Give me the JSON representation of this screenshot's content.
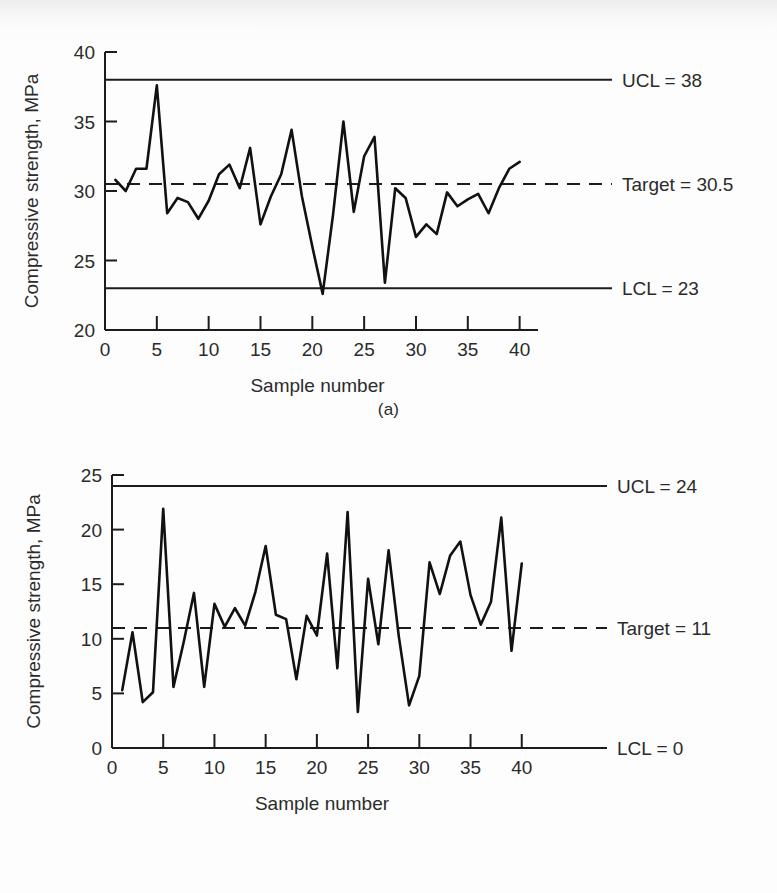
{
  "figures": [
    {
      "id": "a",
      "caption": "(a)",
      "chart_data": {
        "type": "line",
        "title": "",
        "xlabel": "Sample number",
        "ylabel": "Compressive strength, MPa",
        "xlim": [
          0,
          41
        ],
        "ylim": [
          20,
          40
        ],
        "xticks": [
          0,
          5,
          10,
          15,
          20,
          25,
          30,
          35,
          40
        ],
        "yticks": [
          20,
          25,
          30,
          35,
          40
        ],
        "grid": false,
        "legend_position": "right-inline",
        "x": [
          1,
          2,
          3,
          4,
          5,
          6,
          7,
          8,
          9,
          10,
          11,
          12,
          13,
          14,
          15,
          16,
          17,
          18,
          19,
          20,
          21,
          22,
          23,
          24,
          25,
          26,
          27,
          28,
          29,
          30,
          31,
          32,
          33,
          34,
          35,
          36,
          37,
          38,
          39,
          40
        ],
        "values": [
          30.8,
          30.0,
          31.6,
          31.6,
          37.6,
          28.4,
          29.5,
          29.2,
          28.0,
          29.3,
          31.2,
          31.9,
          30.2,
          33.1,
          27.6,
          29.6,
          31.2,
          34.4,
          29.6,
          26.0,
          22.6,
          28.3,
          35.0,
          28.5,
          32.5,
          33.9,
          23.4,
          30.2,
          29.5,
          26.7,
          27.6,
          26.9,
          29.9,
          28.9,
          29.4,
          29.8,
          28.4,
          30.2,
          31.6,
          32.1
        ],
        "reference_lines": [
          {
            "name": "UCL",
            "label": "UCL = 38",
            "value": 38,
            "style": "solid"
          },
          {
            "name": "Target",
            "label": "Target = 30.5",
            "value": 30.5,
            "style": "dashed"
          },
          {
            "name": "LCL",
            "label": "LCL = 23",
            "value": 23,
            "style": "solid"
          }
        ]
      }
    },
    {
      "id": "b",
      "caption": "(b)",
      "chart_data": {
        "type": "line",
        "title": "",
        "xlabel": "Sample number",
        "ylabel": "Compressive strength, MPa",
        "xlim": [
          0,
          41
        ],
        "ylim": [
          0,
          25
        ],
        "xticks": [
          0,
          5,
          10,
          15,
          20,
          25,
          30,
          35,
          40
        ],
        "yticks": [
          0,
          5,
          10,
          15,
          20,
          25
        ],
        "grid": false,
        "legend_position": "right-inline",
        "x": [
          1,
          2,
          3,
          4,
          5,
          6,
          7,
          8,
          9,
          10,
          11,
          12,
          13,
          14,
          15,
          16,
          17,
          18,
          19,
          20,
          21,
          22,
          23,
          24,
          25,
          26,
          27,
          28,
          29,
          30,
          31,
          32,
          33,
          34,
          35,
          36,
          37,
          38,
          39,
          40
        ],
        "values": [
          5.3,
          10.6,
          4.2,
          5.1,
          21.9,
          5.6,
          9.7,
          14.2,
          5.6,
          13.2,
          11.1,
          12.8,
          11.2,
          14.3,
          18.5,
          12.2,
          11.8,
          6.3,
          12.1,
          10.3,
          17.8,
          7.3,
          21.6,
          3.3,
          15.5,
          9.5,
          18.1,
          10.2,
          3.9,
          6.6,
          17.0,
          14.1,
          17.6,
          18.9,
          14.0,
          11.3,
          13.4,
          21.1,
          8.9,
          16.9
        ],
        "reference_lines": [
          {
            "name": "UCL",
            "label": "UCL = 24",
            "value": 24,
            "style": "solid"
          },
          {
            "name": "Target",
            "label": "Target = 11",
            "value": 11,
            "style": "dashed"
          },
          {
            "name": "LCL",
            "label": "LCL = 0",
            "value": 0,
            "style": "solid"
          }
        ]
      }
    }
  ]
}
